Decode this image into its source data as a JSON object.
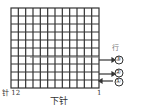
{
  "grid": {
    "columns": 12,
    "rows": 10,
    "emphasized_row_line": 7
  },
  "labels": {
    "row_label": "行",
    "bottom_title": "下针",
    "stitch_left": "针 12",
    "stitch_right": "1"
  },
  "rows": [
    {
      "marker": "③",
      "direction": "out"
    },
    {
      "marker": "②",
      "direction": "out"
    },
    {
      "marker": "①",
      "direction": "in"
    }
  ]
}
